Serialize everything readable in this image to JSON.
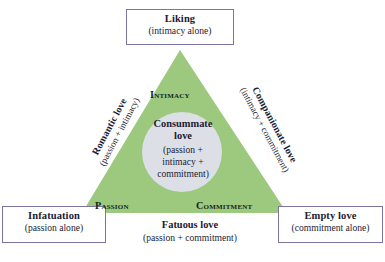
{
  "figure": {
    "type": "triangular-theory-of-love-diagram",
    "colors": {
      "triangle_fill": "#9cc97e",
      "circle_fill": "#dce0e6",
      "box_border": "#7a74a0",
      "text": "#1b1b33",
      "vertex_label_text": "#15251a",
      "background": "#ffffff"
    },
    "geometry": {
      "apex": [
        180,
        50
      ],
      "bottom_left": [
        82,
        213
      ],
      "bottom_right": [
        287,
        213
      ],
      "circle_center": [
        182,
        152
      ],
      "circle_radius": 40
    }
  },
  "corner_boxes": [
    {
      "id": "liking",
      "title": "Liking",
      "subtitle": "(intimacy alone)"
    },
    {
      "id": "infatuation",
      "title": "Infatuation",
      "subtitle": "(passion alone)"
    },
    {
      "id": "empty_love",
      "title": "Empty love",
      "subtitle": "(commitment alone)"
    }
  ],
  "vertex_labels": {
    "intimacy": "Intimacy",
    "passion": "Passion",
    "commitment": "Commitment"
  },
  "center": {
    "title": "Consummate love",
    "title_line1": "Consummate",
    "title_line2": "love",
    "subtitle": "(passion + intimacy + commitment)",
    "sub_line1": "(passion +",
    "sub_line2": "intimacy +",
    "sub_line3": "commitment)"
  },
  "edge_labels": [
    {
      "id": "romantic_love",
      "title": "Romantic love",
      "subtitle": "(passion + intimacy)"
    },
    {
      "id": "companionate_love",
      "title": "Companionate love",
      "subtitle": "(intimacy + commitment)"
    },
    {
      "id": "fatuous_love",
      "title": "Fatuous love",
      "subtitle": "(passion + commitment)"
    }
  ]
}
